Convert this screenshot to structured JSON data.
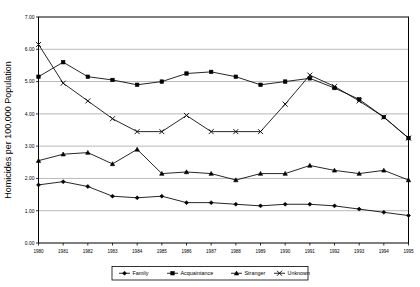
{
  "chart_data": {
    "type": "line",
    "title": "",
    "xlabel": "Year",
    "ylabel": "Homicides per 100,000 Population",
    "x": [
      1980,
      1981,
      1982,
      1983,
      1984,
      1985,
      1986,
      1987,
      1988,
      1989,
      1990,
      1991,
      1992,
      1993,
      1994,
      1995
    ],
    "categories": [
      "1980",
      "1981",
      "1982",
      "1983",
      "1984",
      "1985",
      "1986",
      "1987",
      "1988",
      "1989",
      "1990",
      "1991",
      "1992",
      "1993",
      "1994",
      "1995"
    ],
    "xlim": [
      1980,
      1995
    ],
    "ylim": [
      0.0,
      7.0
    ],
    "ytick_labels": [
      "0.00",
      "1.00",
      "2.00",
      "3.00",
      "4.00",
      "5.00",
      "6.00",
      "7.00"
    ],
    "ytick_values": [
      0.0,
      1.0,
      2.0,
      3.0,
      4.0,
      5.0,
      6.0,
      7.0
    ],
    "grid": true,
    "legend_position": "bottom",
    "series": [
      {
        "name": "Family",
        "marker": "diamond",
        "values": [
          1.8,
          1.9,
          1.75,
          1.45,
          1.4,
          1.45,
          1.25,
          1.25,
          1.2,
          1.15,
          1.2,
          1.2,
          1.15,
          1.05,
          0.95,
          0.85
        ]
      },
      {
        "name": "Acquaintance",
        "marker": "square",
        "values": [
          5.15,
          5.6,
          5.15,
          5.05,
          4.9,
          5.0,
          5.25,
          5.3,
          5.15,
          4.9,
          5.0,
          5.1,
          4.8,
          4.45,
          3.9,
          3.25
        ]
      },
      {
        "name": "Stranger",
        "marker": "triangle",
        "values": [
          2.55,
          2.75,
          2.8,
          2.45,
          2.9,
          2.15,
          2.2,
          2.15,
          1.95,
          2.15,
          2.15,
          2.4,
          2.25,
          2.15,
          2.25,
          1.95
        ]
      },
      {
        "name": "Unknown",
        "marker": "x",
        "values": [
          6.15,
          4.95,
          4.4,
          3.85,
          3.45,
          3.45,
          3.95,
          3.45,
          3.45,
          3.45,
          4.3,
          5.2,
          4.85,
          4.4,
          3.9,
          3.25
        ]
      }
    ]
  },
  "legend": {
    "items": [
      {
        "label": "Family"
      },
      {
        "label": "Acquaintance"
      },
      {
        "label": "Stranger"
      },
      {
        "label": "Unknown"
      }
    ]
  },
  "colors": {
    "series": "#000000",
    "grid": "#9a9a9a",
    "axis": "#000000",
    "background": "#ffffff"
  }
}
